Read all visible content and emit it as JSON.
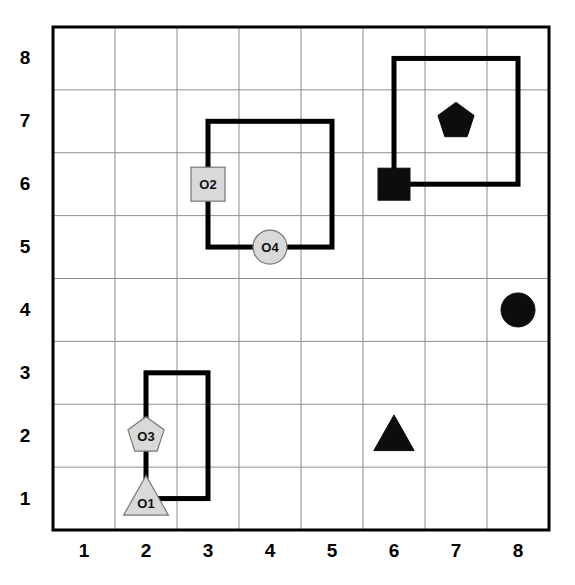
{
  "figure": {
    "kind": "grid-scatter-diagram",
    "grid": {
      "x_min": 0,
      "x_max": 8,
      "y_min": 0,
      "y_max": 8,
      "cells_x": 8,
      "cells_y": 8,
      "gridline_color": "#808080",
      "border_color": "#000000"
    },
    "x_axis": {
      "ticks": [
        "1",
        "2",
        "3",
        "4",
        "5",
        "6",
        "7",
        "8"
      ]
    },
    "y_axis": {
      "ticks": [
        "1",
        "2",
        "3",
        "4",
        "5",
        "6",
        "7",
        "8"
      ]
    }
  },
  "colors": {
    "object_fill": "#d9d9d9",
    "object_stroke": "#777777",
    "solid_fill": "#0d0d0d",
    "box_stroke": "#000000",
    "grid": "#8c8c8c"
  },
  "objects": [
    {
      "id": "O2",
      "label": "O2",
      "shape": "square",
      "x": 3,
      "y": 6,
      "fill": "gray",
      "size": 17
    },
    {
      "id": "O4",
      "label": "O4",
      "shape": "circle",
      "x": 4,
      "y": 5,
      "fill": "gray",
      "size": 17
    },
    {
      "id": "O3",
      "label": "O3",
      "shape": "pentagon",
      "x": 2,
      "y": 2,
      "fill": "gray",
      "size": 19
    },
    {
      "id": "O1",
      "label": "O1",
      "shape": "triangle",
      "x": 2,
      "y": 1,
      "fill": "gray",
      "size": 20
    }
  ],
  "markers": [
    {
      "id": "m-pentagon",
      "label": "",
      "shape": "pentagon",
      "x": 7,
      "y": 7,
      "fill": "black",
      "size": 19
    },
    {
      "id": "m-square",
      "label": "",
      "shape": "square",
      "x": 6,
      "y": 6,
      "fill": "black",
      "size": 16
    },
    {
      "id": "m-circle",
      "label": "",
      "shape": "circle",
      "x": 8,
      "y": 4,
      "fill": "black",
      "size": 17
    },
    {
      "id": "m-triangle",
      "label": "",
      "shape": "triangle",
      "x": 6,
      "y": 2,
      "fill": "black",
      "size": 18
    }
  ],
  "regions": [
    {
      "id": "region-left",
      "x0": 1.5,
      "y0": 0.5,
      "x1": 2.5,
      "y1": 2.5
    },
    {
      "id": "region-middle",
      "x0": 2.5,
      "y0": 4.5,
      "x1": 4.5,
      "y1": 6.5
    },
    {
      "id": "region-topright",
      "x0": 5.5,
      "y0": 5.5,
      "x1": 7.5,
      "y1": 7.5
    }
  ],
  "chart_data": {
    "type": "scatter",
    "title": "",
    "xlabel": "",
    "ylabel": "",
    "xlim": [
      0,
      8
    ],
    "ylim": [
      0,
      8
    ],
    "grid": true,
    "legend": "none",
    "xticks": [
      1,
      2,
      3,
      4,
      5,
      6,
      7,
      8
    ],
    "yticks": [
      1,
      2,
      3,
      4,
      5,
      6,
      7,
      8
    ],
    "series": [
      {
        "name": "labeled objects (gray)",
        "points": [
          {
            "label": "O2",
            "shape": "square",
            "x": 3,
            "y": 6
          },
          {
            "label": "O4",
            "shape": "circle",
            "x": 4,
            "y": 5
          },
          {
            "label": "O3",
            "shape": "pentagon",
            "x": 2,
            "y": 2
          },
          {
            "label": "O1",
            "shape": "triangle",
            "x": 2,
            "y": 1
          }
        ]
      },
      {
        "name": "solid markers (black)",
        "points": [
          {
            "label": "",
            "shape": "pentagon",
            "x": 7,
            "y": 7
          },
          {
            "label": "",
            "shape": "square",
            "x": 6,
            "y": 6
          },
          {
            "label": "",
            "shape": "circle",
            "x": 8,
            "y": 4
          },
          {
            "label": "",
            "shape": "triangle",
            "x": 6,
            "y": 2
          }
        ]
      }
    ],
    "annotations": [
      {
        "type": "rect",
        "x0": 1.5,
        "y0": 0.5,
        "x1": 2.5,
        "y1": 2.5
      },
      {
        "type": "rect",
        "x0": 2.5,
        "y0": 4.5,
        "x1": 4.5,
        "y1": 6.5
      },
      {
        "type": "rect",
        "x0": 5.5,
        "y0": 5.5,
        "x1": 7.5,
        "y1": 7.5
      }
    ]
  }
}
